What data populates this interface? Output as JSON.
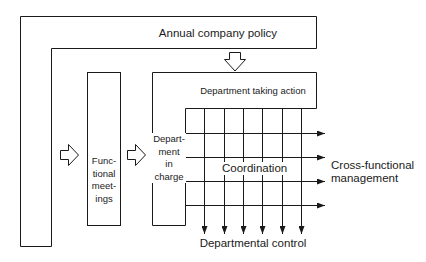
{
  "diagram": {
    "top_bar": {
      "label": "Annual company policy"
    },
    "functional_box": {
      "lines": [
        "Func-",
        "tional",
        "meet-",
        "ings"
      ]
    },
    "department_action_box": {
      "label": "Department taking action"
    },
    "department_charge_box": {
      "lines": [
        "Depart-",
        "ment",
        "in",
        "charge"
      ]
    },
    "coordination": {
      "label": "Coordination"
    },
    "cross_functional": {
      "lines": [
        "Cross-functional",
        "management"
      ]
    },
    "departmental_control": {
      "label": "Departmental control"
    },
    "arrows": {
      "policy_down_arrow": "hollow-down-arrow",
      "to_functional_arrow": "hollow-right-arrow",
      "to_department_arrow": "hollow-right-arrow",
      "horizontal_count": 4,
      "vertical_count": 6
    },
    "colors": {
      "stroke": "#1a1a1a",
      "background": "#ffffff"
    }
  }
}
